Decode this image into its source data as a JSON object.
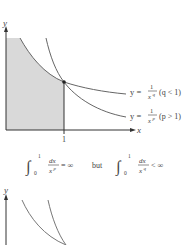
{
  "figure_top": {
    "axis_labels": {
      "x": "x",
      "y": "y"
    },
    "tick_x": "1",
    "curves": [
      {
        "id": "q-curve",
        "y_eq": "y =",
        "numerator": "1",
        "denominator_base": "x",
        "exponent": "q",
        "condition": "(q < 1)"
      },
      {
        "id": "p-curve",
        "y_eq": "y =",
        "numerator": "1",
        "denominator_base": "x",
        "exponent": "p",
        "condition": "(p > 1)"
      }
    ],
    "shaded_region": "area under y = 1/x^q from 0 to 1",
    "colors": {
      "shade": "#d6d6d6",
      "curve": "#6a6a6a",
      "axis": "#333333"
    }
  },
  "equation": {
    "left": {
      "lower": "0",
      "upper": "1",
      "num": "dx",
      "den_base": "x",
      "den_exp": "p",
      "rel": "= ∞"
    },
    "connector": "but",
    "right": {
      "lower": "0",
      "upper": "1",
      "num": "dx",
      "den_base": "x",
      "den_exp": "q",
      "rel": "< ∞"
    }
  },
  "figure_bottom": {
    "axis_labels": {
      "y": "y"
    }
  }
}
